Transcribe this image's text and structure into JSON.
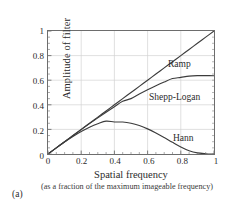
{
  "figure": {
    "panel_label": "(a)"
  },
  "chart_data": {
    "type": "line",
    "title": "",
    "xlabel": "Spatial frequency",
    "xsublabel": "(as a fraction of the maximum imageable frequency)",
    "ylabel": "Amplitude of filter",
    "xlim": [
      0,
      1
    ],
    "ylim": [
      0,
      1
    ],
    "grid": true,
    "legend_position": "inline-annotations",
    "xticks": [
      "0",
      "0.2",
      "0.4",
      "0.6",
      "0.8",
      "1"
    ],
    "xtick_values": [
      0,
      0.2,
      0.4,
      0.6,
      0.8,
      1
    ],
    "yticks": [
      "0",
      "0.2",
      "0.4",
      "0.6",
      "0.8",
      "1"
    ],
    "ytick_values": [
      0,
      0.2,
      0.4,
      0.6,
      0.8,
      1
    ],
    "x": [
      0,
      0.05,
      0.1,
      0.15,
      0.2,
      0.25,
      0.3,
      0.35,
      0.4,
      0.45,
      0.5,
      0.55,
      0.6,
      0.65,
      0.7,
      0.75,
      0.8,
      0.85,
      0.9,
      0.95,
      1
    ],
    "series": [
      {
        "name": "Ramp",
        "color": "#3c3c3c",
        "values": [
          0,
          0.05,
          0.1,
          0.15,
          0.2,
          0.25,
          0.3,
          0.35,
          0.4,
          0.45,
          0.5,
          0.55,
          0.6,
          0.65,
          0.7,
          0.75,
          0.8,
          0.85,
          0.9,
          0.95,
          1
        ]
      },
      {
        "name": "Shepp-Logan",
        "color": "#3c3c3c",
        "values": [
          0,
          0.05,
          0.0999,
          0.1494,
          0.1984,
          0.2467,
          0.294,
          0.3401,
          0.3849,
          0.4281,
          0.4502,
          0.4871,
          0.522,
          0.5548,
          0.5853,
          0.6134,
          0.6229,
          0.6333,
          0.6369,
          0.637,
          0.6366
        ]
      },
      {
        "name": "Hann",
        "color": "#3c3c3c",
        "values": [
          0,
          0.0497,
          0.0976,
          0.1423,
          0.1827,
          0.2175,
          0.246,
          0.2671,
          0.2603,
          0.2599,
          0.25,
          0.2311,
          0.2043,
          0.1712,
          0.1338,
          0.0947,
          0.0573,
          0.0262,
          0.0087,
          0.0025,
          0
        ]
      }
    ],
    "annotations": [
      {
        "text": "Ramp",
        "x": 0.78,
        "y": 0.82
      },
      {
        "text": "Shepp-Logan",
        "x": 0.62,
        "y": 0.53
      },
      {
        "text": "Hann",
        "x": 0.82,
        "y": 0.19
      }
    ]
  }
}
